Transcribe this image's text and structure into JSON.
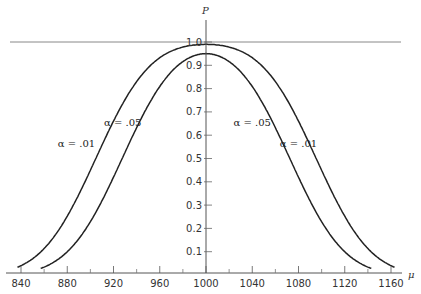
{
  "chart_data": {
    "type": "line",
    "title": "",
    "xlabel": "μ",
    "ylabel": "P",
    "xlim": [
      830,
      1170
    ],
    "ylim": [
      0,
      1.0
    ],
    "x_ticks": [
      840,
      880,
      920,
      960,
      1000,
      1040,
      1080,
      1120,
      1160
    ],
    "x_minor_ticks": [
      860,
      900,
      940,
      980,
      1020,
      1060,
      1100,
      1140
    ],
    "y_ticks": [
      0.1,
      0.2,
      0.3,
      0.4,
      0.5,
      0.6,
      0.7,
      0.8,
      0.9,
      1.0
    ],
    "y_tick_labels": [
      "0.1",
      "0.2",
      "0.3",
      "0.4",
      "0.5",
      "0.6",
      "0.7",
      "0.8",
      "0.9",
      "1.0"
    ],
    "grid": false,
    "reference_line": {
      "y": 1.0
    },
    "series": [
      {
        "name": "α = .01",
        "x": [
          840,
          860,
          880,
          900,
          920,
          940,
          960,
          980,
          1000,
          1020,
          1040,
          1060,
          1080,
          1100,
          1120,
          1140,
          1160
        ],
        "values": [
          1.0,
          0.99,
          0.97,
          0.9,
          0.73,
          0.48,
          0.23,
          0.07,
          0.01,
          0.07,
          0.23,
          0.48,
          0.73,
          0.9,
          0.97,
          0.99,
          1.0
        ]
      },
      {
        "name": "α = .05",
        "x": [
          860,
          880,
          900,
          920,
          940,
          960,
          980,
          1000,
          1020,
          1040,
          1060,
          1080,
          1100,
          1120,
          1140
        ],
        "values": [
          1.0,
          0.99,
          0.96,
          0.87,
          0.67,
          0.41,
          0.17,
          0.05,
          0.17,
          0.41,
          0.67,
          0.87,
          0.96,
          0.99,
          1.0
        ]
      }
    ],
    "annotations": [
      {
        "text": "α = .01",
        "x": 888,
        "y": 0.55,
        "side": "left"
      },
      {
        "text": "α = .05",
        "x": 928,
        "y": 0.64,
        "side": "left"
      },
      {
        "text": "α = .05",
        "x": 1040,
        "y": 0.64,
        "side": "right"
      },
      {
        "text": "α = .01",
        "x": 1080,
        "y": 0.55,
        "side": "right"
      }
    ]
  }
}
